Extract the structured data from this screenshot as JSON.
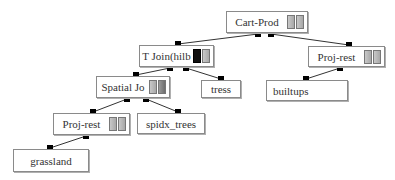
{
  "diagram": {
    "type": "query-plan-tree",
    "nodes": [
      {
        "id": "cart-prod",
        "label": "Cart-Prod",
        "icons": [
          "light",
          "light"
        ],
        "box": [
          226,
          11,
          82,
          22
        ],
        "in": [],
        "out": [
          258,
          271
        ]
      },
      {
        "id": "t-join",
        "label": "T Join(hilb",
        "icons": [
          "dark",
          "light"
        ],
        "box": [
          139,
          45,
          75,
          22
        ],
        "in": [
          178
        ],
        "out": [
          170,
          186
        ]
      },
      {
        "id": "proj-rest-right",
        "label": "Proj-rest",
        "icons": [
          "light",
          "light"
        ],
        "box": [
          308,
          46,
          77,
          21
        ],
        "in": [
          349
        ],
        "out": [
          340
        ]
      },
      {
        "id": "spatial-join",
        "label": "Spatial Jo",
        "icons": [
          "light",
          "mid"
        ],
        "box": [
          96,
          76,
          74,
          22
        ],
        "in": [
          136
        ],
        "out": [
          127,
          146
        ]
      },
      {
        "id": "tress",
        "label": "tress",
        "icons": [],
        "box": [
          201,
          80,
          40,
          18
        ],
        "in": [
          221
        ],
        "out": []
      },
      {
        "id": "builtups",
        "label": "builtups",
        "icons": [],
        "box": [
          266,
          80,
          82,
          21
        ],
        "in": [
          306
        ],
        "out": [],
        "align": "left"
      },
      {
        "id": "proj-rest-left",
        "label": "Proj-rest",
        "icons": [
          "light",
          "light"
        ],
        "box": [
          53,
          113,
          77,
          22
        ],
        "in": [
          93
        ],
        "out": [
          86
        ]
      },
      {
        "id": "spidx-trees",
        "label": "spidx_trees",
        "icons": [],
        "box": [
          137,
          113,
          68,
          21
        ],
        "in": [
          178
        ],
        "out": []
      },
      {
        "id": "grassland",
        "label": "grassland",
        "icons": [],
        "box": [
          13,
          149,
          76,
          23
        ],
        "in": [
          50
        ],
        "out": []
      }
    ],
    "edges": [
      {
        "from": "cart-prod",
        "from_port": 0,
        "to": "t-join"
      },
      {
        "from": "cart-prod",
        "from_port": 1,
        "to": "proj-rest-right"
      },
      {
        "from": "t-join",
        "from_port": 0,
        "to": "spatial-join"
      },
      {
        "from": "t-join",
        "from_port": 1,
        "to": "tress"
      },
      {
        "from": "proj-rest-right",
        "from_port": 0,
        "to": "builtups"
      },
      {
        "from": "spatial-join",
        "from_port": 0,
        "to": "proj-rest-left"
      },
      {
        "from": "spatial-join",
        "from_port": 1,
        "to": "spidx-trees"
      },
      {
        "from": "proj-rest-left",
        "from_port": 0,
        "to": "grassland"
      }
    ]
  },
  "labels": {
    "cart_prod": "Cart-Prod",
    "t_join": "T Join(hilb",
    "proj_rest_right": "Proj-rest",
    "spatial_join": "Spatial Jo",
    "tress": "tress",
    "builtups": "builtups",
    "proj_rest_left": "Proj-rest",
    "spidx_trees": "spidx_trees",
    "grassland": "grassland"
  }
}
